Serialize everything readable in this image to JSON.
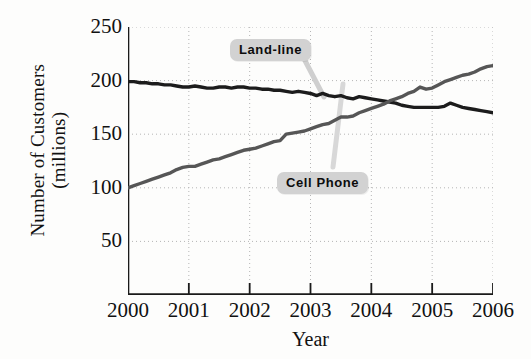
{
  "chart_data": {
    "type": "line",
    "title": "",
    "xlabel": "Year",
    "ylabel": "Number of Customers (millions)",
    "ylabel_line1": "Number of Customers",
    "ylabel_line2": "(millions)",
    "xlim": [
      2000,
      2006
    ],
    "ylim": [
      0,
      250
    ],
    "yticks": [
      250,
      200,
      150,
      100,
      50
    ],
    "xticks": [
      "2000",
      "2001",
      "2002",
      "2003",
      "2004",
      "2005",
      "2006"
    ],
    "grid": "dotted",
    "legend_position": "inline-callouts",
    "annotations": [
      {
        "text": "Land-line",
        "points_to_series": "Land-line"
      },
      {
        "text": "Cell Phone",
        "points_to_series": "Cell Phone"
      }
    ],
    "series": [
      {
        "name": "Land-line",
        "color": "#1c1c1c",
        "x": [
          2000.0,
          2000.1,
          2000.2,
          2000.3,
          2000.4,
          2000.5,
          2000.6,
          2000.7,
          2000.8,
          2000.9,
          2001.0,
          2001.1,
          2001.2,
          2001.3,
          2001.4,
          2001.5,
          2001.6,
          2001.7,
          2001.8,
          2001.9,
          2002.0,
          2002.1,
          2002.2,
          2002.3,
          2002.4,
          2002.5,
          2002.6,
          2002.7,
          2002.8,
          2002.9,
          2003.0,
          2003.1,
          2003.2,
          2003.3,
          2003.4,
          2003.5,
          2003.6,
          2003.7,
          2003.8,
          2003.9,
          2004.0,
          2004.1,
          2004.2,
          2004.3,
          2004.4,
          2004.5,
          2004.6,
          2004.7,
          2004.8,
          2004.9,
          2005.0,
          2005.1,
          2005.2,
          2005.3,
          2005.4,
          2005.5,
          2005.6,
          2005.7,
          2005.8,
          2005.9,
          2006.0
        ],
        "values": [
          199,
          199,
          198,
          198,
          197,
          197,
          196,
          196,
          195,
          194,
          194,
          195,
          194,
          193,
          193,
          194,
          194,
          193,
          194,
          194,
          193,
          193,
          192,
          192,
          191,
          191,
          190,
          189,
          190,
          189,
          188,
          186,
          188,
          186,
          185,
          186,
          184,
          183,
          185,
          184,
          183,
          182,
          181,
          180,
          179,
          177,
          176,
          175,
          175,
          175,
          175,
          175,
          176,
          179,
          177,
          175,
          174,
          173,
          172,
          171,
          170
        ]
      },
      {
        "name": "Cell Phone",
        "color": "#565656",
        "x": [
          2000.0,
          2000.1,
          2000.2,
          2000.3,
          2000.4,
          2000.5,
          2000.6,
          2000.7,
          2000.8,
          2000.9,
          2001.0,
          2001.1,
          2001.2,
          2001.3,
          2001.4,
          2001.5,
          2001.6,
          2001.7,
          2001.8,
          2001.9,
          2002.0,
          2002.1,
          2002.2,
          2002.3,
          2002.4,
          2002.5,
          2002.6,
          2002.7,
          2002.8,
          2002.9,
          2003.0,
          2003.1,
          2003.2,
          2003.3,
          2003.4,
          2003.5,
          2003.6,
          2003.7,
          2003.8,
          2003.9,
          2004.0,
          2004.1,
          2004.2,
          2004.3,
          2004.4,
          2004.5,
          2004.6,
          2004.7,
          2004.8,
          2004.9,
          2005.0,
          2005.1,
          2005.2,
          2005.3,
          2005.4,
          2005.5,
          2005.6,
          2005.7,
          2005.8,
          2005.9,
          2006.0
        ],
        "values": [
          100,
          102,
          104,
          106,
          108,
          110,
          112,
          114,
          117,
          119,
          120,
          120,
          122,
          124,
          126,
          127,
          129,
          131,
          133,
          135,
          136,
          137,
          139,
          141,
          143,
          144,
          150,
          151,
          152,
          153,
          155,
          157,
          159,
          160,
          163,
          166,
          166,
          167,
          170,
          172,
          174,
          176,
          178,
          181,
          183,
          185,
          188,
          190,
          194,
          192,
          193,
          196,
          199,
          201,
          203,
          205,
          206,
          208,
          211,
          213,
          214
        ]
      }
    ]
  }
}
